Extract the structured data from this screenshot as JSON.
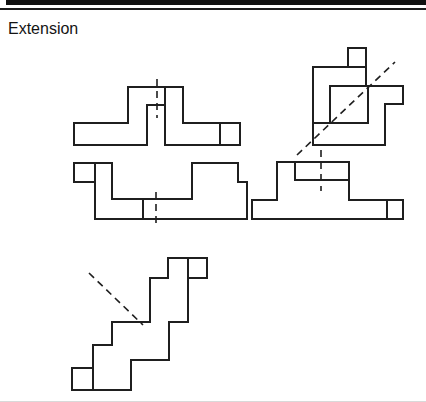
{
  "page": {
    "title": "Extension"
  },
  "figure": {
    "stroke_color": "#1f1f1f",
    "dash_color": "#1f1f1f",
    "dash_pattern": "7 5",
    "shapes": [
      {
        "name": "shape-cross-with-bottom-notch",
        "mirror_line_orientation": "vertical",
        "segments": [
          [
            74,
            123,
            128,
            123
          ],
          [
            128,
            123,
            128,
            87
          ],
          [
            128,
            87,
            183,
            87
          ],
          [
            183,
            87,
            183,
            123
          ],
          [
            183,
            123,
            240,
            123
          ],
          [
            240,
            123,
            240,
            145
          ],
          [
            240,
            145,
            165,
            145
          ],
          [
            165,
            145,
            165,
            87
          ],
          [
            165,
            105,
            147,
            105
          ],
          [
            147,
            105,
            147,
            145
          ],
          [
            147,
            145,
            74,
            145
          ],
          [
            74,
            145,
            74,
            123
          ],
          [
            220,
            123,
            220,
            145
          ]
        ],
        "dashed": [
          [
            157,
            79,
            157,
            118
          ]
        ]
      },
      {
        "name": "shape-block-with-inner-square-diagonal-mirror",
        "mirror_line_orientation": "diagonal",
        "segments": [
          [
            313,
            67,
            366,
            67
          ],
          [
            348,
            48,
            366,
            48
          ],
          [
            348,
            48,
            348,
            67
          ],
          [
            366,
            48,
            366,
            86
          ],
          [
            330,
            86,
            403,
            86
          ],
          [
            330,
            86,
            330,
            123
          ],
          [
            313,
            123,
            368,
            123
          ],
          [
            368,
            86,
            368,
            123
          ],
          [
            403,
            86,
            403,
            104
          ],
          [
            403,
            104,
            385,
            104
          ],
          [
            385,
            104,
            385,
            145
          ],
          [
            385,
            145,
            313,
            145
          ],
          [
            313,
            145,
            313,
            67
          ]
        ],
        "dashed": [
          [
            297,
            155,
            395,
            62
          ]
        ]
      },
      {
        "name": "shape-wide-bracket-vertical-mirror",
        "mirror_line_orientation": "vertical",
        "segments": [
          [
            74,
            163,
            112,
            163
          ],
          [
            74,
            163,
            74,
            182
          ],
          [
            74,
            182,
            95,
            182
          ],
          [
            95,
            163,
            95,
            219
          ],
          [
            112,
            163,
            112,
            199
          ],
          [
            112,
            199,
            192,
            199
          ],
          [
            192,
            199,
            192,
            163
          ],
          [
            192,
            163,
            238,
            163
          ],
          [
            238,
            163,
            238,
            182
          ],
          [
            238,
            182,
            247,
            182
          ],
          [
            247,
            182,
            247,
            219
          ],
          [
            247,
            219,
            95,
            219
          ],
          [
            143,
            199,
            143,
            219
          ]
        ],
        "dashed": [
          [
            156,
            192,
            156,
            226
          ]
        ]
      },
      {
        "name": "shape-step-bracket-vertical-mirror",
        "mirror_line_orientation": "vertical",
        "segments": [
          [
            277,
            162,
            349,
            162
          ],
          [
            277,
            162,
            277,
            200
          ],
          [
            252,
            200,
            277,
            200
          ],
          [
            252,
            200,
            252,
            219
          ],
          [
            252,
            219,
            403,
            219
          ],
          [
            295,
            162,
            295,
            180
          ],
          [
            295,
            180,
            349,
            180
          ],
          [
            349,
            162,
            349,
            200
          ],
          [
            349,
            200,
            403,
            200
          ],
          [
            403,
            200,
            403,
            219
          ],
          [
            387,
            200,
            387,
            219
          ]
        ],
        "dashed": [
          [
            321,
            150,
            321,
            191
          ]
        ]
      },
      {
        "name": "shape-staircase-diagonal-mirror",
        "mirror_line_orientation": "diagonal",
        "segments": [
          [
            168,
            258,
            207,
            258
          ],
          [
            207,
            258,
            207,
            278
          ],
          [
            207,
            278,
            188,
            278
          ],
          [
            188,
            278,
            188,
            322
          ],
          [
            188,
            322,
            169,
            322
          ],
          [
            169,
            322,
            169,
            360
          ],
          [
            169,
            360,
            131,
            360
          ],
          [
            131,
            390,
            131,
            360
          ],
          [
            131,
            390,
            72,
            390
          ],
          [
            72,
            390,
            72,
            368
          ],
          [
            72,
            368,
            93,
            368
          ],
          [
            93,
            368,
            93,
            345
          ],
          [
            93,
            345,
            112,
            345
          ],
          [
            112,
            345,
            112,
            322
          ],
          [
            112,
            322,
            150,
            322
          ],
          [
            150,
            322,
            150,
            278
          ],
          [
            150,
            278,
            168,
            278
          ],
          [
            168,
            278,
            168,
            258
          ],
          [
            93,
            368,
            93,
            390
          ],
          [
            188,
            258,
            188,
            278
          ]
        ],
        "dashed": [
          [
            89,
            273,
            143,
            325
          ]
        ]
      }
    ]
  }
}
